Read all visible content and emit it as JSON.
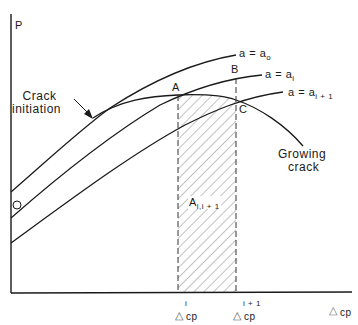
{
  "diagram": {
    "type": "load-displacement curves with crack growth",
    "y_axis_label": "P",
    "origin_label": "O",
    "curves": [
      {
        "id": "a0",
        "label_main": "a = a",
        "label_sub": "o"
      },
      {
        "id": "ai",
        "label_main": "a = a",
        "label_sub": "i"
      },
      {
        "id": "ai1",
        "label_main": "a = a",
        "label_sub": "i + 1"
      }
    ],
    "points": {
      "A": "A",
      "B": "B",
      "C": "C"
    },
    "annotations": {
      "crack_initiation_line1": "Crack",
      "crack_initiation_line2": "initiation",
      "growing_crack_line1": "Growing",
      "growing_crack_line2": "crack",
      "area_main": "A",
      "area_sub": "i,i + 1"
    },
    "x_ticks": [
      {
        "symbol": "△",
        "sub": "cp",
        "sup": "i"
      },
      {
        "symbol": "△",
        "sub": "cp",
        "sup": "i + 1"
      }
    ],
    "x_axis_label": {
      "symbol": "△",
      "sub": "cp"
    },
    "colors": {
      "line": "#1a1a1a",
      "hatch": "#555555",
      "background": "#ffffff"
    }
  }
}
